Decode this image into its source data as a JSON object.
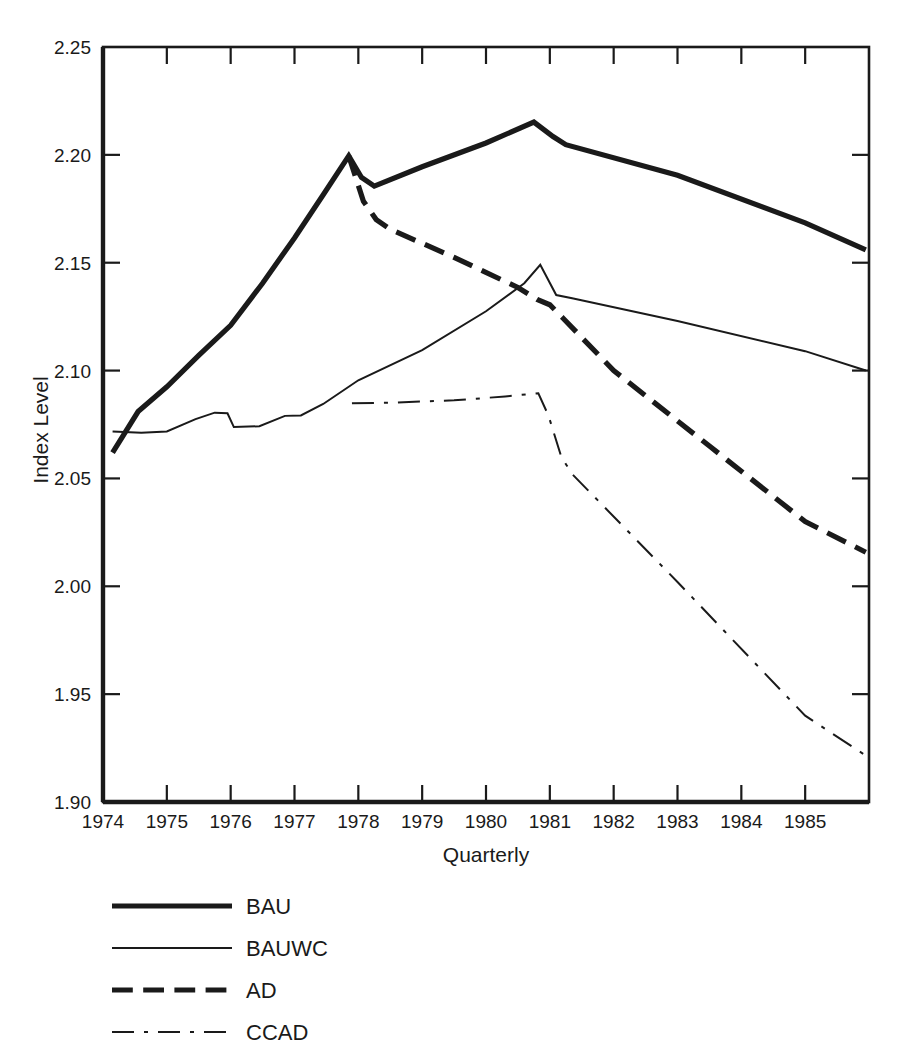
{
  "chart_data": {
    "type": "line",
    "title": "",
    "xlabel": "Quarterly",
    "ylabel": "Index Level",
    "xlim": [
      1974.0,
      1986.0
    ],
    "ylim": [
      1.9,
      2.25
    ],
    "grid": false,
    "legend_position": "below-left",
    "x_tick_labels": [
      "1974",
      "1975",
      "1976",
      "1977",
      "1978",
      "1979",
      "1980",
      "1981",
      "1982",
      "1983",
      "1984",
      "1985"
    ],
    "x_tick_values": [
      1974,
      1975,
      1976,
      1977,
      1978,
      1979,
      1980,
      1981,
      1982,
      1983,
      1984,
      1985
    ],
    "y_tick_labels": [
      "2.25",
      "2.20",
      "2.15",
      "2.10",
      "2.05",
      "2.00",
      "1.95",
      "1.90"
    ],
    "y_tick_values": [
      2.25,
      2.2,
      2.15,
      2.1,
      2.05,
      2.0,
      1.95,
      1.9
    ],
    "series": [
      {
        "name": "BAU",
        "style": "solid",
        "width": 5.2,
        "color": "#1a1a1a",
        "x": [
          1974.15,
          1974.55,
          1975.0,
          1975.5,
          1976.0,
          1976.5,
          1977.0,
          1977.45,
          1977.85,
          1978.05,
          1978.25,
          1979.0,
          1980.0,
          1980.75,
          1981.05,
          1981.25,
          1983.0,
          1985.0,
          1985.95
        ],
        "y": [
          2.062,
          2.081,
          2.0925,
          2.107,
          2.121,
          2.1405,
          2.1615,
          2.1815,
          2.1995,
          2.1895,
          2.1855,
          2.1945,
          2.2055,
          2.2152,
          2.2085,
          2.2047,
          2.1905,
          2.1685,
          2.156
        ]
      },
      {
        "name": "BAUWC",
        "style": "solid",
        "width": 2.0,
        "color": "#1a1a1a",
        "x": [
          1974.15,
          1974.6,
          1975.0,
          1975.45,
          1975.75,
          1975.95,
          1976.05,
          1976.45,
          1976.85,
          1977.1,
          1977.45,
          1978.0,
          1979.0,
          1980.0,
          1980.6,
          1980.85,
          1981.1,
          1981.35,
          1983.0,
          1985.0,
          1985.95
        ],
        "y": [
          2.0718,
          2.0712,
          2.0718,
          2.0775,
          2.0805,
          2.0802,
          2.0738,
          2.0742,
          2.079,
          2.0792,
          2.0845,
          2.0955,
          2.1095,
          2.1275,
          2.1405,
          2.149,
          2.135,
          2.1335,
          2.123,
          2.109,
          2.1
        ]
      },
      {
        "name": "AD",
        "style": "dashed",
        "width": 5.2,
        "color": "#1a1a1a",
        "x": [
          1977.85,
          1978.08,
          1978.28,
          1978.5,
          1979.5,
          1980.5,
          1980.8,
          1981.0,
          1981.2,
          1982.0,
          1983.5,
          1985.0,
          1985.95
        ],
        "y": [
          2.1995,
          2.1785,
          2.17,
          2.1655,
          2.1525,
          2.1385,
          2.133,
          2.1305,
          2.1245,
          2.1,
          2.065,
          2.03,
          2.0158
        ]
      },
      {
        "name": "CCAD",
        "style": "dashdot",
        "width": 2.0,
        "color": "#1a1a1a",
        "x": [
          1977.9,
          1978.6,
          1979.5,
          1980.3,
          1980.82,
          1980.98,
          1981.18,
          1981.35,
          1983.0,
          1985.0,
          1985.95
        ],
        "y": [
          2.0848,
          2.0852,
          2.0862,
          2.088,
          2.0895,
          2.079,
          2.06,
          2.052,
          2.002,
          1.94,
          1.9215
        ]
      }
    ]
  },
  "legend": {
    "entries": [
      {
        "label": "BAU",
        "style": "solid",
        "width": 5.2
      },
      {
        "label": "BAUWC",
        "style": "solid",
        "width": 2.0
      },
      {
        "label": "AD",
        "style": "dashed",
        "width": 5.2
      },
      {
        "label": "CCAD",
        "style": "dashdot",
        "width": 2.0
      }
    ]
  }
}
